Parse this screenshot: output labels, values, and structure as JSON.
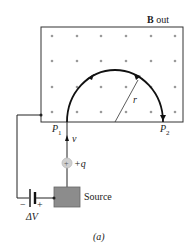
{
  "figure": {
    "field_label_bold": "B",
    "field_label_rest": " out",
    "radius_label": "r",
    "p1_label": "P",
    "p1_sub": "1",
    "p2_label": "P",
    "p2_sub": "2",
    "velocity_label": "v",
    "charge_label": "+q",
    "source_label": "Source",
    "battery_minus": "−",
    "battery_plus": "+",
    "voltage_label": "ΔV",
    "caption": "(a)"
  },
  "colors": {
    "line": "#222222",
    "dot": "#9a9a9a",
    "source_fill": "#8c8c8c",
    "charge_fill": "#d0d0d0"
  }
}
